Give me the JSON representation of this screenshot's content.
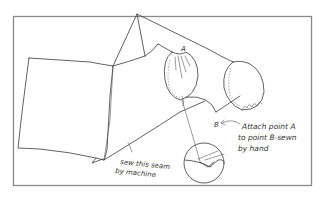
{
  "figure": {
    "type": "sewing-instruction-diagram",
    "frame_color": "#8a8a8a",
    "ink_color": "#3a3a3a",
    "background": "#ffffff"
  },
  "labels": {
    "point_a": "A",
    "point_b": "B",
    "machine_note_line1": "sew this seam",
    "machine_note_line2": "by machine",
    "hand_note_line1": "Attach point A",
    "hand_note_line2": "to point B-sewn",
    "hand_note_line3": "by hand"
  },
  "elements": [
    {
      "name": "fabric-panel",
      "description": "square body panel on left"
    },
    {
      "name": "sleeve-tube",
      "description": "diagonal sleeve extending to upper right"
    },
    {
      "name": "mitten-a",
      "description": "left mitten/hand piece with stitched edge, point A at cuff"
    },
    {
      "name": "mitten-b",
      "description": "right mitten/hand piece with stitched edge"
    },
    {
      "name": "seam-detail-magnifier",
      "description": "circular close-up of seam stitch"
    }
  ]
}
